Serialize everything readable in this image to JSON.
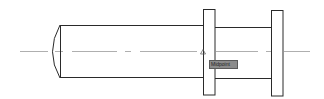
{
  "drawing": {
    "background": "#ffffff",
    "line_color": "#2a2a2a",
    "centerline_color": "#9a9a9a"
  },
  "snap": {
    "marker_icon": "midpoint-triangle-icon",
    "tooltip_label": "Midpoint"
  }
}
